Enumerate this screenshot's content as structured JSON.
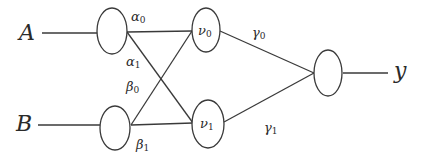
{
  "diagram": {
    "type": "network-graph",
    "inputs": [
      {
        "id": "A",
        "label": "A"
      },
      {
        "id": "B",
        "label": "B"
      }
    ],
    "hidden": [
      {
        "id": "nu0",
        "symbol": "ν",
        "sub": "0"
      },
      {
        "id": "nu1",
        "symbol": "ν",
        "sub": "1"
      }
    ],
    "output": {
      "id": "y",
      "label": "y"
    },
    "weights": {
      "alpha0": {
        "symbol": "α",
        "sub": "0",
        "from": "A",
        "to": "nu0"
      },
      "alpha1": {
        "symbol": "α",
        "sub": "1",
        "from": "A",
        "to": "nu1"
      },
      "beta0": {
        "symbol": "β",
        "sub": "0",
        "from": "B",
        "to": "nu0"
      },
      "beta1": {
        "symbol": "β",
        "sub": "1",
        "from": "B",
        "to": "nu1"
      },
      "gamma0": {
        "symbol": "γ",
        "sub": "0",
        "from": "nu0",
        "to": "y"
      },
      "gamma1": {
        "symbol": "γ",
        "sub": "1",
        "from": "nu1",
        "to": "y"
      }
    },
    "colors": {
      "stroke": "#3a3a3a",
      "text": "#2a2a2a",
      "background": "#ffffff"
    }
  }
}
